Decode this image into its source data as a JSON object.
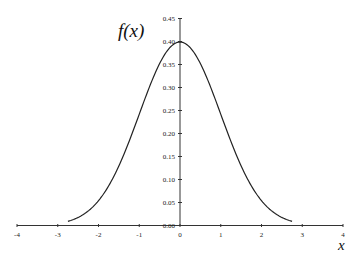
{
  "chart_data": {
    "type": "line",
    "title": "",
    "xlabel": "x",
    "ylabel": "f(x)",
    "xlim": [
      -4,
      4
    ],
    "ylim": [
      0,
      0.45
    ],
    "grid": false,
    "legend": null,
    "x_ticks": [
      "-4",
      "-3",
      "-2",
      "-1",
      "0",
      "1",
      "2",
      "3",
      "4"
    ],
    "y_ticks": [
      "0.00",
      "0.05",
      "0.10",
      "0.15",
      "0.20",
      "0.25",
      "0.30",
      "0.35",
      "0.40",
      "0.45"
    ],
    "series": [
      {
        "name": "Standard normal density",
        "color": "#222222",
        "x": [
          -2.75,
          -2.5,
          -2.25,
          -2.0,
          -1.75,
          -1.5,
          -1.25,
          -1.0,
          -0.75,
          -0.5,
          -0.25,
          0.0,
          0.25,
          0.5,
          0.75,
          1.0,
          1.25,
          1.5,
          1.75,
          2.0,
          2.25,
          2.5,
          2.75
        ],
        "y": [
          0.0091,
          0.0175,
          0.0317,
          0.054,
          0.0863,
          0.1295,
          0.1826,
          0.242,
          0.3011,
          0.3521,
          0.3867,
          0.3989,
          0.3867,
          0.3521,
          0.3011,
          0.242,
          0.1826,
          0.1295,
          0.0863,
          0.054,
          0.0317,
          0.0175,
          0.0091
        ]
      }
    ]
  },
  "labels": {
    "y_axis_title": "f(x)",
    "x_axis_title": "x"
  }
}
